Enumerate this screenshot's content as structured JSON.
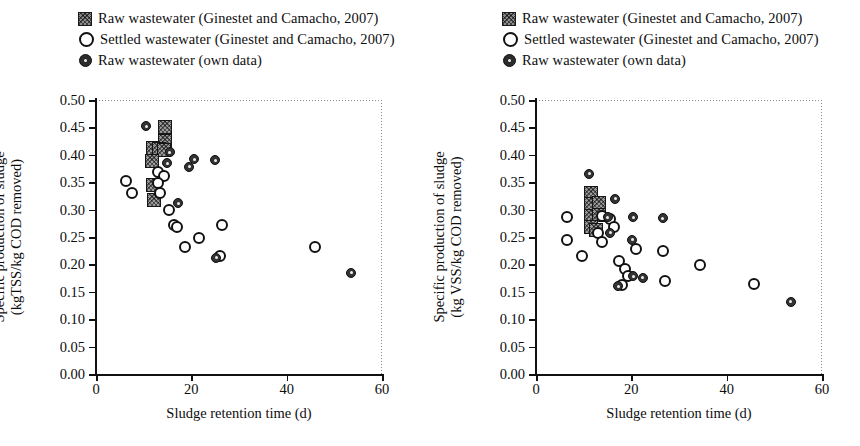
{
  "figure": {
    "panels": [
      {
        "id": "left",
        "legend": [
          {
            "marker": "hatched-square",
            "label": "Raw wastewater (Ginestet and Camacho, 2007)"
          },
          {
            "marker": "open-circle",
            "label": "Settled wastewater (Ginestet and Camacho, 2007)"
          },
          {
            "marker": "filled-dot",
            "label": "Raw wastewater (own data)"
          }
        ],
        "chart_data": {
          "type": "scatter",
          "title": "",
          "xlabel": "Sludge retention time (d)",
          "ylabel": "Specific production of sludge (kgTSS/kg COD removed)",
          "ylabel_line1": "Specific production of sludge",
          "ylabel_line2": "(kgTSS/kg COD removed)",
          "xlim": [
            0,
            60
          ],
          "ylim": [
            0.0,
            0.5
          ],
          "xticks": [
            0,
            20,
            40,
            60
          ],
          "yticks": [
            "0.00",
            "0.05",
            "0.10",
            "0.15",
            "0.20",
            "0.25",
            "0.30",
            "0.35",
            "0.40",
            "0.45",
            "0.50"
          ],
          "grid": false,
          "legend_position": "above-plot",
          "series": [
            {
              "name": "Raw wastewater (Ginestet and Camacho, 2007)",
              "marker": "hatched-square",
              "points": [
                [
                  14.5,
                  0.45
                ],
                [
                  14.5,
                  0.425
                ],
                [
                  12.0,
                  0.412
                ],
                [
                  13.2,
                  0.41
                ],
                [
                  14.3,
                  0.408
                ],
                [
                  11.7,
                  0.388
                ],
                [
                  12.0,
                  0.345
                ],
                [
                  12.1,
                  0.318
                ]
              ]
            },
            {
              "name": "Settled wastewater (Ginestet and Camacho, 2007)",
              "marker": "open-circle",
              "points": [
                [
                  6.2,
                  0.352
                ],
                [
                  7.6,
                  0.33
                ],
                [
                  13.1,
                  0.368
                ],
                [
                  14.2,
                  0.362
                ],
                [
                  13.0,
                  0.348
                ],
                [
                  13.4,
                  0.33
                ],
                [
                  15.3,
                  0.3
                ],
                [
                  16.4,
                  0.272
                ],
                [
                  17.0,
                  0.268
                ],
                [
                  18.6,
                  0.232
                ],
                [
                  21.6,
                  0.248
                ],
                [
                  26.4,
                  0.272
                ],
                [
                  26.0,
                  0.215
                ],
                [
                  46.0,
                  0.232
                ]
              ]
            },
            {
              "name": "Raw wastewater (own data)",
              "marker": "filled-dot",
              "points": [
                [
                  10.5,
                  0.452
                ],
                [
                  15.5,
                  0.405
                ],
                [
                  14.9,
                  0.385
                ],
                [
                  20.6,
                  0.392
                ],
                [
                  25.0,
                  0.39
                ],
                [
                  19.6,
                  0.378
                ],
                [
                  17.3,
                  0.312
                ],
                [
                  25.2,
                  0.212
                ],
                [
                  53.5,
                  0.185
                ]
              ]
            }
          ]
        }
      },
      {
        "id": "right",
        "legend": [
          {
            "marker": "hatched-square",
            "label": "Raw wastewater (Ginestet and Camacho, 2007)"
          },
          {
            "marker": "open-circle",
            "label": "Settled wastewater (Ginestet and Camacho, 2007)"
          },
          {
            "marker": "filled-dot",
            "label": "Raw wastewater (own data)"
          }
        ],
        "chart_data": {
          "type": "scatter",
          "title": "",
          "xlabel": "Sludge retention time (d)",
          "ylabel": "Specific production of sludge (kg VSS/kg COD removed)",
          "ylabel_line1": "Specific production of sludge",
          "ylabel_line2": "(kg VSS/kg COD removed)",
          "xlim": [
            0,
            60
          ],
          "ylim": [
            0.0,
            0.5
          ],
          "xticks": [
            0,
            20,
            40,
            60
          ],
          "yticks": [
            "0.00",
            "0.05",
            "0.10",
            "0.15",
            "0.20",
            "0.25",
            "0.30",
            "0.35",
            "0.40",
            "0.45",
            "0.50"
          ],
          "grid": false,
          "legend_position": "above-plot",
          "series": [
            {
              "name": "Raw wastewater (Ginestet and Camacho, 2007)",
              "marker": "hatched-square",
              "points": [
                [
                  11.6,
                  0.33
                ],
                [
                  11.6,
                  0.31
                ],
                [
                  13.3,
                  0.312
                ],
                [
                  11.6,
                  0.288
                ],
                [
                  13.3,
                  0.29
                ],
                [
                  11.6,
                  0.268
                ],
                [
                  12.6,
                  0.262
                ]
              ]
            },
            {
              "name": "Settled wastewater (Ginestet and Camacho, 2007)",
              "marker": "open-circle",
              "points": [
                [
                  6.4,
                  0.286
                ],
                [
                  6.6,
                  0.245
                ],
                [
                  13.9,
                  0.288
                ],
                [
                  15.6,
                  0.282
                ],
                [
                  16.4,
                  0.268
                ],
                [
                  13.1,
                  0.258
                ],
                [
                  13.8,
                  0.24
                ],
                [
                  9.6,
                  0.216
                ],
                [
                  17.4,
                  0.206
                ],
                [
                  18.6,
                  0.192
                ],
                [
                  19.4,
                  0.178
                ],
                [
                  21.0,
                  0.228
                ],
                [
                  26.6,
                  0.224
                ],
                [
                  18.0,
                  0.162
                ],
                [
                  27.0,
                  0.17
                ],
                [
                  34.4,
                  0.198
                ],
                [
                  45.8,
                  0.164
                ]
              ]
            },
            {
              "name": "Raw wastewater (own data)",
              "marker": "filled-dot",
              "points": [
                [
                  11.2,
                  0.365
                ],
                [
                  16.6,
                  0.32
                ],
                [
                  15.0,
                  0.286
                ],
                [
                  20.4,
                  0.286
                ],
                [
                  26.6,
                  0.284
                ],
                [
                  20.2,
                  0.245
                ],
                [
                  15.6,
                  0.258
                ],
                [
                  20.4,
                  0.178
                ],
                [
                  22.4,
                  0.176
                ],
                [
                  17.3,
                  0.16
                ],
                [
                  53.4,
                  0.132
                ]
              ]
            }
          ]
        }
      }
    ]
  }
}
